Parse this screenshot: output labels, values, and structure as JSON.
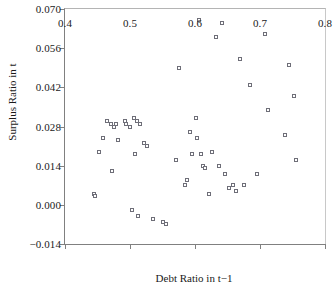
{
  "chart_data": {
    "type": "scatter",
    "title": "",
    "xlabel": "Debt Ratio in t−1",
    "ylabel": "Surplus Ratio in t",
    "xlim": [
      0.4,
      0.8
    ],
    "ylim": [
      -0.014,
      0.07
    ],
    "xticks": [
      "0.4",
      "0.5",
      "0.6",
      "0.7",
      "0.8"
    ],
    "xtick_values": [
      0.4,
      0.5,
      0.6,
      0.7,
      0.8
    ],
    "yticks": [
      "-0.014",
      "0.000",
      "0.014",
      "0.028",
      "0.042",
      "0.056",
      "0.070"
    ],
    "ytick_values": [
      -0.014,
      0.0,
      0.014,
      0.028,
      0.042,
      0.056,
      0.07
    ],
    "grid": false,
    "legend": null,
    "marker": "open-square",
    "marker_color": "#6e6e78",
    "points": [
      {
        "x": 0.444,
        "y": 0.004
      },
      {
        "x": 0.446,
        "y": 0.003
      },
      {
        "x": 0.452,
        "y": 0.019
      },
      {
        "x": 0.458,
        "y": 0.024
      },
      {
        "x": 0.465,
        "y": 0.03
      },
      {
        "x": 0.47,
        "y": 0.029
      },
      {
        "x": 0.472,
        "y": 0.012
      },
      {
        "x": 0.476,
        "y": 0.028
      },
      {
        "x": 0.479,
        "y": 0.029
      },
      {
        "x": 0.482,
        "y": 0.023
      },
      {
        "x": 0.492,
        "y": 0.03
      },
      {
        "x": 0.494,
        "y": 0.029
      },
      {
        "x": 0.5,
        "y": 0.028
      },
      {
        "x": 0.503,
        "y": -0.002
      },
      {
        "x": 0.506,
        "y": 0.031
      },
      {
        "x": 0.508,
        "y": 0.018
      },
      {
        "x": 0.511,
        "y": 0.03
      },
      {
        "x": 0.512,
        "y": -0.004
      },
      {
        "x": 0.516,
        "y": 0.029
      },
      {
        "x": 0.521,
        "y": 0.022
      },
      {
        "x": 0.526,
        "y": 0.021
      },
      {
        "x": 0.536,
        "y": -0.005
      },
      {
        "x": 0.551,
        "y": -0.006
      },
      {
        "x": 0.555,
        "y": -0.007
      },
      {
        "x": 0.57,
        "y": 0.016
      },
      {
        "x": 0.576,
        "y": 0.049
      },
      {
        "x": 0.584,
        "y": 0.007
      },
      {
        "x": 0.588,
        "y": 0.009
      },
      {
        "x": 0.592,
        "y": 0.026
      },
      {
        "x": 0.596,
        "y": 0.018
      },
      {
        "x": 0.601,
        "y": 0.031
      },
      {
        "x": 0.603,
        "y": 0.024
      },
      {
        "x": 0.606,
        "y": 0.066
      },
      {
        "x": 0.609,
        "y": 0.018
      },
      {
        "x": 0.612,
        "y": 0.014
      },
      {
        "x": 0.615,
        "y": 0.013
      },
      {
        "x": 0.621,
        "y": 0.004
      },
      {
        "x": 0.626,
        "y": 0.019
      },
      {
        "x": 0.632,
        "y": 0.06
      },
      {
        "x": 0.637,
        "y": 0.014
      },
      {
        "x": 0.642,
        "y": 0.065
      },
      {
        "x": 0.646,
        "y": 0.011
      },
      {
        "x": 0.652,
        "y": 0.006
      },
      {
        "x": 0.658,
        "y": 0.007
      },
      {
        "x": 0.663,
        "y": 0.005
      },
      {
        "x": 0.669,
        "y": 0.052
      },
      {
        "x": 0.676,
        "y": 0.007
      },
      {
        "x": 0.684,
        "y": 0.043
      },
      {
        "x": 0.696,
        "y": 0.011
      },
      {
        "x": 0.708,
        "y": 0.061
      },
      {
        "x": 0.712,
        "y": 0.034
      },
      {
        "x": 0.738,
        "y": 0.025
      },
      {
        "x": 0.745,
        "y": 0.05
      },
      {
        "x": 0.752,
        "y": 0.039
      },
      {
        "x": 0.756,
        "y": 0.016
      }
    ]
  }
}
